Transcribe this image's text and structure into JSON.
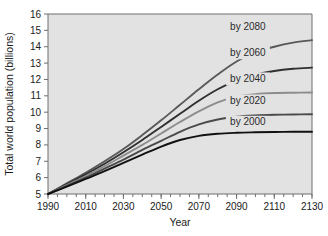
{
  "chart_data": {
    "type": "line",
    "title": "",
    "xlabel": "Year",
    "ylabel": "Total world population (billions)",
    "xlim": [
      1990,
      2130
    ],
    "ylim": [
      5,
      16
    ],
    "grid": false,
    "legend_position": "inline-right-of-curve",
    "x_ticks": [
      1990,
      2010,
      2030,
      2050,
      2070,
      2090,
      2110,
      2130
    ],
    "x_minor_tick_step": 5,
    "y_ticks": [
      5,
      6,
      7,
      8,
      9,
      10,
      11,
      12,
      13,
      14,
      15,
      16
    ],
    "x": [
      1990,
      2000,
      2010,
      2020,
      2030,
      2040,
      2050,
      2060,
      2070,
      2080,
      2090,
      2100,
      2110,
      2120,
      2130
    ],
    "series": [
      {
        "name": "by 2080",
        "label": "by 2080",
        "color": "#595959",
        "plateau": 14.4,
        "label_x": 2096,
        "label_y": 15.0,
        "values": [
          5.0,
          5.65,
          6.3,
          7.0,
          7.75,
          8.6,
          9.5,
          10.45,
          11.4,
          12.3,
          13.1,
          13.65,
          14.0,
          14.25,
          14.4
        ]
      },
      {
        "name": "by 2060",
        "label": "by 2060",
        "color": "#303030",
        "plateau": 12.72,
        "label_x": 2096,
        "label_y": 13.45,
        "values": [
          5.0,
          5.6,
          6.2,
          6.85,
          7.55,
          8.3,
          9.1,
          9.9,
          10.7,
          11.4,
          11.95,
          12.3,
          12.52,
          12.65,
          12.72
        ]
      },
      {
        "name": "by 2040",
        "label": "by 2040",
        "color": "#8c8c8c",
        "plateau": 11.2,
        "label_x": 2096,
        "label_y": 11.85,
        "values": [
          5.0,
          5.55,
          6.1,
          6.7,
          7.35,
          8.0,
          8.7,
          9.4,
          10.05,
          10.6,
          10.95,
          11.1,
          11.17,
          11.19,
          11.2
        ]
      },
      {
        "name": "by 2020",
        "label": "by 2020",
        "color": "#4a4a4a",
        "plateau": 9.87,
        "label_x": 2096,
        "label_y": 10.5,
        "values": [
          5.0,
          5.5,
          6.0,
          6.55,
          7.1,
          7.7,
          8.25,
          8.8,
          9.25,
          9.55,
          9.72,
          9.8,
          9.84,
          9.86,
          9.87
        ]
      },
      {
        "name": "by 2000",
        "label": "by 2000",
        "color": "#111111",
        "plateau": 8.8,
        "label_x": 2096,
        "label_y": 9.2,
        "values": [
          5.0,
          5.45,
          5.92,
          6.4,
          6.9,
          7.4,
          7.9,
          8.3,
          8.55,
          8.68,
          8.74,
          8.77,
          8.79,
          8.8,
          8.8
        ]
      }
    ]
  },
  "axes": {
    "x_title": "Year",
    "y_title": "Total world population (billions)",
    "x_tick_labels": [
      "1990",
      "2010",
      "2030",
      "2050",
      "2070",
      "2090",
      "2110",
      "2130"
    ],
    "y_tick_labels": [
      "5",
      "6",
      "7",
      "8",
      "9",
      "10",
      "11",
      "12",
      "13",
      "14",
      "15",
      "16"
    ]
  },
  "colors": {
    "plot_background": "#e2e2e2",
    "page_background": "#ffffff",
    "axis": "#6e6e6e",
    "text": "#1a1a1a"
  }
}
